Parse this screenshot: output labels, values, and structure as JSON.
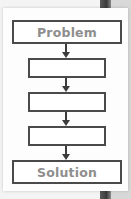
{
  "diagram": {
    "type": "flowchart",
    "direction": "top-to-bottom",
    "nodes": [
      {
        "id": "problem",
        "label": "Problem"
      },
      {
        "id": "step-1",
        "label": ""
      },
      {
        "id": "step-2",
        "label": ""
      },
      {
        "id": "step-3",
        "label": ""
      },
      {
        "id": "solution",
        "label": "Solution"
      }
    ],
    "edges": [
      {
        "from": "problem",
        "to": "step-1"
      },
      {
        "from": "step-1",
        "to": "step-2"
      },
      {
        "from": "step-2",
        "to": "step-3"
      },
      {
        "from": "step-3",
        "to": "solution"
      }
    ],
    "colors": {
      "border": "#4a4a4a",
      "label_text": "#8e8e8e",
      "arrow": "#3c3c3c",
      "card": "#fdfdfd"
    }
  }
}
